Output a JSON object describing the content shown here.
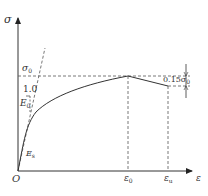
{
  "diagram": {
    "type": "stress-strain curve",
    "axes": {
      "y_label": "σ",
      "x_label": "ε",
      "origin_label": "O"
    },
    "labels": {
      "peak_stress": "σ",
      "peak_stress_sub": "0",
      "slope_unit": "1.0",
      "initial_modulus": "E",
      "initial_modulus_sub": "0",
      "secant_modulus": "E",
      "secant_modulus_sub": "s",
      "peak_strain": "ε",
      "peak_strain_sub": "0",
      "ultimate_strain": "ε",
      "ultimate_strain_sub": "u",
      "drop_annotation": "0.15σ",
      "drop_annotation_sub": "0"
    },
    "colors": {
      "line": "#333333",
      "dashed": "#555555",
      "background": "#ffffff"
    }
  }
}
